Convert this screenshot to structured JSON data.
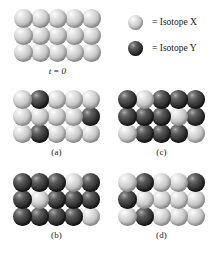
{
  "figure": {
    "legend": {
      "items": [
        {
          "swatch": "light-sphere-icon",
          "label": "= Isotope X"
        },
        {
          "swatch": "dark-sphere-icon",
          "label": "= Isotope Y"
        }
      ]
    },
    "colors": {
      "isotope_x_light": "#dcdcdc",
      "isotope_x_highlight": "#ffffff",
      "isotope_x_shadow": "#7d7d7d",
      "isotope_y_dark": "#2c2c2c",
      "isotope_y_highlight": "#b5b5b5",
      "isotope_y_shadow": "#1b1b1b",
      "background": "#ffffff",
      "text": "#1a1a1a"
    },
    "grid_shape": {
      "rows": 3,
      "cols": 5,
      "total_spheres": 15
    },
    "panels": [
      {
        "id": "initial",
        "caption": "t = 0",
        "caption_var": "t",
        "caption_value": "0",
        "rows": [
          [
            "light",
            "light",
            "light",
            "light",
            "light"
          ],
          [
            "light",
            "light",
            "light",
            "light",
            "light"
          ],
          [
            "light",
            "light",
            "light",
            "light",
            "light"
          ]
        ],
        "counts": {
          "isotope_x": 15,
          "isotope_y": 0
        }
      },
      {
        "id": "a",
        "caption": "(a)",
        "rows": [
          [
            "light",
            "dark",
            "light",
            "light",
            "light"
          ],
          [
            "light",
            "light",
            "light",
            "light",
            "dark"
          ],
          [
            "light",
            "dark",
            "light",
            "light",
            "light"
          ]
        ],
        "counts": {
          "isotope_x": 12,
          "isotope_y": 3
        }
      },
      {
        "id": "b",
        "caption": "(b)",
        "rows": [
          [
            "dark",
            "dark",
            "dark",
            "light",
            "dark"
          ],
          [
            "dark",
            "light",
            "dark",
            "dark",
            "dark"
          ],
          [
            "dark",
            "dark",
            "dark",
            "dark",
            "light"
          ]
        ],
        "counts": {
          "isotope_x": 3,
          "isotope_y": 12
        }
      },
      {
        "id": "c",
        "caption": "(c)",
        "rows": [
          [
            "dark",
            "light",
            "dark",
            "dark",
            "dark"
          ],
          [
            "dark",
            "dark",
            "dark",
            "light",
            "dark"
          ],
          [
            "light",
            "dark",
            "dark",
            "dark",
            "light"
          ]
        ],
        "counts": {
          "isotope_x": 4,
          "isotope_y": 11
        }
      },
      {
        "id": "d",
        "caption": "(d)",
        "rows": [
          [
            "light",
            "dark",
            "light",
            "light",
            "dark"
          ],
          [
            "dark",
            "light",
            "light",
            "light",
            "light"
          ],
          [
            "light",
            "dark",
            "light",
            "light",
            "light"
          ]
        ],
        "counts": {
          "isotope_x": 11,
          "isotope_y": 4
        }
      }
    ]
  }
}
